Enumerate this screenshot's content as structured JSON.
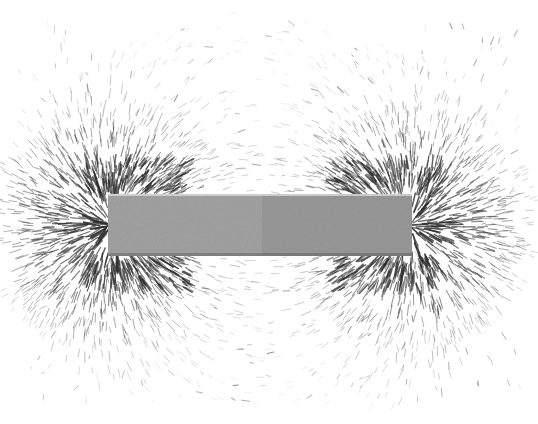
{
  "figure": {
    "medium": "black and white photograph",
    "caption": "",
    "background_color": "#ffffff",
    "width": 538,
    "height": 424
  },
  "magnet": {
    "label": "",
    "shape": "rectangular bar",
    "x": 108,
    "y": 194,
    "width": 304,
    "height": 62,
    "divider_x": 262,
    "north_half": {
      "pole": "N",
      "label": "",
      "color": "#a3a3a3",
      "x": 108,
      "width": 154
    },
    "south_half": {
      "pole": "S",
      "label": "",
      "color": "#999999",
      "x": 262,
      "width": 150
    },
    "edge_highlight_color": "#d8d8d8",
    "edge_shadow_color": "#5a5a5a"
  },
  "field": {
    "filing_color": "#2b2b2b",
    "pole_left": {
      "cx": 112,
      "cy": 225,
      "label": ""
    },
    "pole_right": {
      "cx": 408,
      "cy": 225,
      "label": ""
    },
    "neutral_zone_x": 262,
    "description": "radial bursts at both poles with arcing lines bridging above and below",
    "outer_arc_top_y": 38,
    "outer_arc_bottom_y": 386,
    "left_extent_x": 26,
    "right_extent_x": 512,
    "seed": 20240517
  },
  "chart_data": {
    "type": "scatter",
    "xlabel": "",
    "ylabel": "",
    "xlim": [
      0,
      538
    ],
    "ylim": [
      0,
      424
    ],
    "grid": false,
    "legend": "none",
    "series": [
      {
        "name": "north-pole-burst",
        "center": [
          112,
          225
        ],
        "kind": "radial-burst",
        "count": 520,
        "inner_radius": 4,
        "outer_radius": 130
      },
      {
        "name": "south-pole-burst",
        "center": [
          408,
          225
        ],
        "kind": "radial-burst",
        "count": 520,
        "inner_radius": 4,
        "outer_radius": 130
      },
      {
        "name": "field-line-arcs",
        "kind": "dipole-arcs",
        "arc_count": 17,
        "count": 1150,
        "note": "filings aligned tangent to dipole field lines looping pole to pole"
      }
    ],
    "annotations": []
  }
}
